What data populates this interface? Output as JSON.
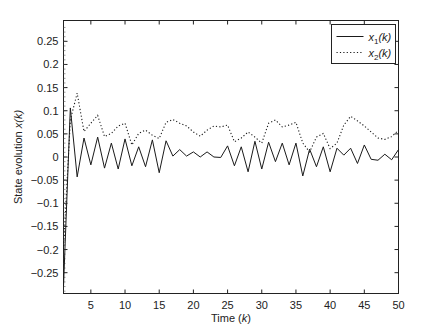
{
  "chart_data": {
    "type": "line",
    "title": "",
    "xlabel": "Time (k)",
    "xlabel_parts": {
      "prefix": "Time (",
      "var": "k",
      "suffix": ")"
    },
    "ylabel": "State evolution x(k)",
    "ylabel_parts": {
      "prefix": "State evolution ",
      "var": "x(k)"
    },
    "xlim": [
      1,
      50
    ],
    "ylim": [
      -0.295,
      0.295
    ],
    "xticks": [
      5,
      10,
      15,
      20,
      25,
      30,
      35,
      40,
      45,
      50
    ],
    "yticks": [
      -0.25,
      -0.2,
      -0.15,
      -0.1,
      -0.05,
      0,
      0.05,
      0.1,
      0.15,
      0.2,
      0.25
    ],
    "ytick_labels": [
      "−0.25",
      "−0.2",
      "−0.15",
      "−0.1",
      "−0.05",
      "0",
      "0.05",
      "0.1",
      "0.15",
      "0.2",
      "0.25"
    ],
    "grid": false,
    "legend_position": "top-right",
    "x": [
      1,
      2,
      3,
      4,
      5,
      6,
      7,
      8,
      9,
      10,
      11,
      12,
      13,
      14,
      15,
      16,
      17,
      18,
      19,
      20,
      21,
      22,
      23,
      24,
      25,
      26,
      27,
      28,
      29,
      30,
      31,
      32,
      33,
      34,
      35,
      36,
      37,
      38,
      39,
      40,
      41,
      42,
      43,
      44,
      45,
      46,
      47,
      48,
      49,
      50
    ],
    "series": [
      {
        "name": "x1(k)",
        "label_base": "x",
        "label_sub": "1",
        "label_suffix": "(k)",
        "style": "solid",
        "color": "#1a1a1a",
        "values": [
          -0.28,
          0.106,
          -0.043,
          0.041,
          -0.017,
          0.043,
          -0.024,
          0.03,
          -0.026,
          0.039,
          -0.019,
          0.022,
          -0.021,
          0.037,
          -0.034,
          0.035,
          0.002,
          0.016,
          0.002,
          0.011,
          0.0,
          0.011,
          0.0,
          -0.001,
          0.024,
          -0.019,
          0.022,
          -0.032,
          0.034,
          -0.026,
          0.032,
          -0.01,
          0.03,
          -0.017,
          0.03,
          -0.041,
          0.017,
          -0.021,
          0.022,
          -0.032,
          0.019,
          0.004,
          0.019,
          -0.014,
          0.026,
          -0.005,
          -0.007,
          0.006,
          -0.006,
          0.016
        ]
      },
      {
        "name": "x2(k)",
        "label_base": "x",
        "label_sub": "2",
        "label_suffix": "(k)",
        "style": "dotted",
        "color": "#1a1a1a",
        "values": [
          -0.2,
          0.08,
          0.138,
          0.055,
          0.073,
          0.09,
          0.044,
          0.051,
          0.067,
          0.073,
          0.026,
          0.051,
          0.058,
          0.047,
          0.04,
          0.075,
          0.081,
          0.073,
          0.067,
          0.054,
          0.045,
          0.058,
          0.067,
          0.065,
          0.069,
          0.033,
          0.041,
          0.054,
          0.043,
          0.03,
          0.073,
          0.08,
          0.065,
          0.069,
          0.075,
          0.03,
          0.011,
          0.043,
          0.051,
          0.018,
          0.03,
          0.069,
          0.088,
          0.078,
          0.067,
          0.054,
          0.041,
          0.038,
          0.044,
          0.058
        ]
      }
    ]
  }
}
